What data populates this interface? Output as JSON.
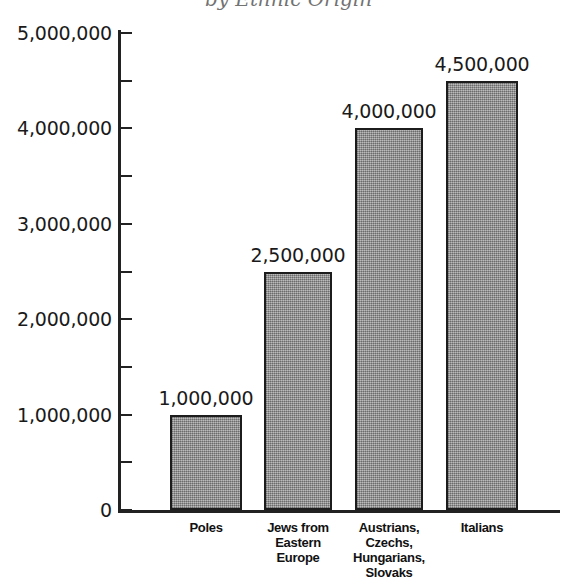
{
  "title": {
    "text": "by Ethnic Origin",
    "visible_state": "cropped-at-top-edge"
  },
  "chart_data": {
    "type": "bar",
    "title": "by Ethnic Origin",
    "xlabel": "",
    "ylabel": "",
    "ylim": [
      0,
      5000000
    ],
    "grid": false,
    "legend": "none",
    "categories": [
      "Poles",
      "Jews from Eastern Europe",
      "Austrians, Czechs, Hungarians, Slovaks",
      "Italians"
    ],
    "values": [
      1000000,
      2500000,
      4000000,
      4500000
    ],
    "value_labels": [
      "1,000,000",
      "2,500,000",
      "4,000,000",
      "4,500,000"
    ],
    "y_tick_values": [
      0,
      1000000,
      2000000,
      3000000,
      4000000,
      5000000
    ],
    "y_tick_labels": [
      "0",
      "1,000,000",
      "2,000,000",
      "3,000,000",
      "4,000,000",
      "5,000,000"
    ],
    "y_minor_tick_values": [
      500000,
      1500000,
      2500000,
      3500000,
      4500000
    ],
    "bar_fill_color": "#9a9a9a",
    "bar_edge_color": "#1c1c1c",
    "background_color": "#ffffff"
  },
  "axis": {
    "y_labels": [
      {
        "text": "5,000,000",
        "value": 5000000
      },
      {
        "text": "4,000,000",
        "value": 4000000
      },
      {
        "text": "3,000,000",
        "value": 3000000
      },
      {
        "text": "2,000,000",
        "value": 2000000
      },
      {
        "text": "1,000,000",
        "value": 1000000
      },
      {
        "text": "0",
        "value": 0
      }
    ]
  },
  "bars": [
    {
      "category_lines": [
        "Poles"
      ],
      "value_label": "1,000,000",
      "value": 1000000
    },
    {
      "category_lines": [
        "Jews from",
        "Eastern",
        "Europe"
      ],
      "value_label": "2,500,000",
      "value": 2500000
    },
    {
      "category_lines": [
        "Austrians,",
        "Czechs,",
        "Hungarians,",
        "Slovaks"
      ],
      "value_label": "4,000,000",
      "value": 4000000
    },
    {
      "category_lines": [
        "Italians"
      ],
      "value_label": "4,500,000",
      "value": 4500000
    }
  ]
}
